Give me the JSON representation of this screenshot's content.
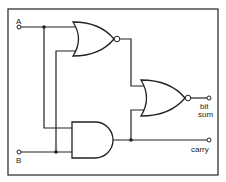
{
  "diagram": {
    "type": "logic-circuit",
    "inputs": [
      {
        "id": "A",
        "label": "A"
      },
      {
        "id": "B",
        "label": "B"
      }
    ],
    "outputs": [
      {
        "id": "sum",
        "label_line1": "bit",
        "label_line2": "sum"
      },
      {
        "id": "carry",
        "label": "carry"
      }
    ],
    "gates": [
      {
        "id": "nor1",
        "type": "NOR",
        "inputs": [
          "A",
          "B"
        ]
      },
      {
        "id": "and1",
        "type": "AND",
        "inputs": [
          "A",
          "B"
        ]
      },
      {
        "id": "nor2",
        "type": "NOR",
        "inputs": [
          "nor1",
          "and1"
        ],
        "output": "bit sum"
      }
    ],
    "colors": {
      "line": "#222222",
      "background": "#ffffff"
    }
  }
}
